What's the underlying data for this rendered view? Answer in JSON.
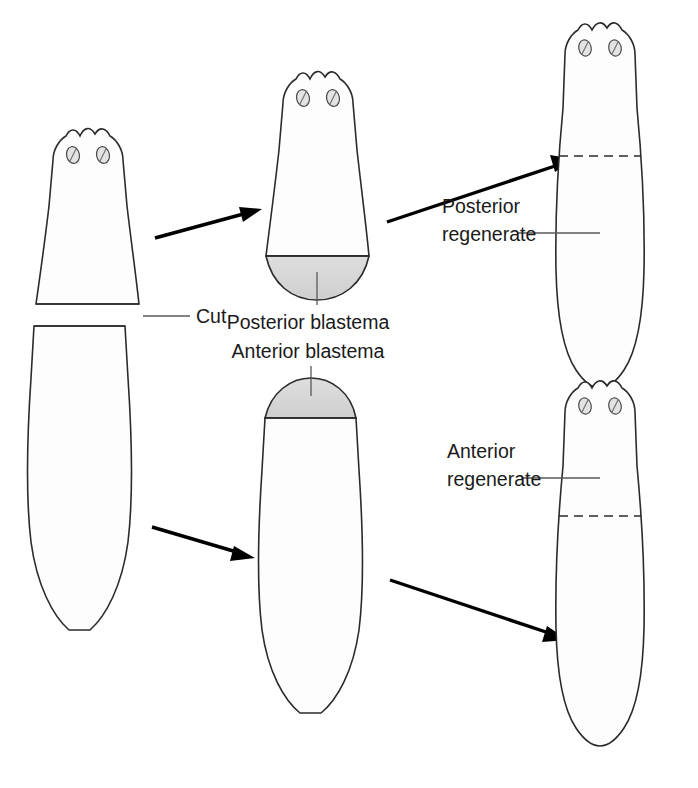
{
  "figure": {
    "background_color": "#ffffff",
    "outline_color": "#2b2b2b",
    "blastema_fill_color": "#d9d9d9",
    "regenerate_fill_color": "#d6d6d6",
    "body_fill_color": "#fdfdfd"
  },
  "labels": {
    "cut": "Cut",
    "posterior_blastema": "Posterior blastema",
    "anterior_blastema": "Anterior  blastema",
    "posterior_regenerate_line1": "Posterior",
    "posterior_regenerate_line2": "regenerate",
    "anterior_regenerate_line1": "Anterior",
    "anterior_regenerate_line2": "regenerate"
  },
  "organisms": [
    {
      "id": "intact-worm-head-fragment",
      "stage": "stage-1",
      "row": "top",
      "description": "Anterior (head) fragment immediately after transverse cut",
      "shaded_region": "none",
      "eyespots": 2
    },
    {
      "id": "head-fragment-with-posterior-blastema",
      "stage": "stage-2",
      "row": "top",
      "description": "Head fragment with posterior blastema forming at cut surface",
      "shaded_region": "posterior-blastema",
      "eyespots": 2
    },
    {
      "id": "regenerated-worm-from-head-fragment",
      "stage": "stage-3",
      "row": "top",
      "description": "Complete worm regenerated from head fragment; posterior regenerate shaded below dashed line",
      "shaded_region": "posterior-regenerate",
      "eyespots": 2
    },
    {
      "id": "tail-fragment",
      "stage": "stage-1",
      "row": "bottom",
      "description": "Posterior (tail) fragment immediately after transverse cut",
      "shaded_region": "none",
      "eyespots": 0
    },
    {
      "id": "tail-fragment-with-anterior-blastema",
      "stage": "stage-2",
      "row": "bottom",
      "description": "Tail fragment with anterior blastema forming at cut surface",
      "shaded_region": "anterior-blastema",
      "eyespots": 0
    },
    {
      "id": "regenerated-worm-from-tail-fragment",
      "stage": "stage-3",
      "row": "bottom",
      "description": "Complete worm regenerated from tail fragment; anterior regenerate shaded above dashed line",
      "shaded_region": "anterior-regenerate",
      "eyespots": 2
    }
  ],
  "arrows": [
    {
      "id": "arrow-head-fragment-to-blastema",
      "from": "intact-worm-head-fragment",
      "to": "head-fragment-with-posterior-blastema"
    },
    {
      "id": "arrow-blastema-to-regenerate",
      "from": "head-fragment-with-posterior-blastema",
      "to": "regenerated-worm-from-head-fragment"
    },
    {
      "id": "arrow-tail-fragment-to-blastema",
      "from": "tail-fragment",
      "to": "tail-fragment-with-anterior-blastema"
    },
    {
      "id": "arrow-tail-blastema-to-regenerate",
      "from": "tail-fragment-with-anterior-blastema",
      "to": "regenerated-worm-from-tail-fragment"
    }
  ]
}
